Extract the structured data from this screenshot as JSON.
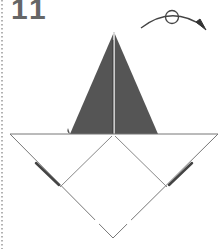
{
  "diagram": {
    "step_number": "11",
    "instruction_icon": "turn-over-icon",
    "colors": {
      "paper_colored_side": "#555555",
      "paper_white_side": "#ffffff",
      "fold_line": "#888888",
      "outline": "#777777",
      "step_number": "#666666",
      "dotted_border": "#999999"
    }
  }
}
